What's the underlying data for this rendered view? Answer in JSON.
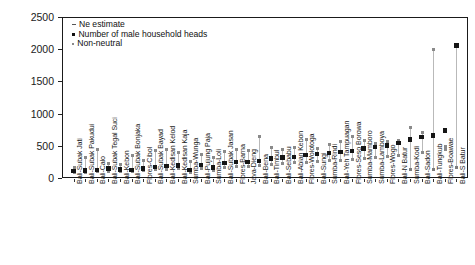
{
  "chart_data": {
    "type": "scatter",
    "title": "",
    "xlabel": "",
    "ylabel": "Effective size (Ne)",
    "ylim": [
      0,
      2500
    ],
    "yticks": [
      0,
      500,
      1000,
      1500,
      2000,
      2500
    ],
    "grid": true,
    "legend_position": "top-left",
    "legend": [
      {
        "marker": "dash",
        "label": "Ne estimate"
      },
      {
        "marker": "dot",
        "label": "Number of male household heads"
      },
      {
        "marker": "tiny",
        "label": "Non-neutral"
      }
    ],
    "categories": [
      "Bali-Subak Jati",
      "Bali-Subak Pakudui",
      "Bali-Calo",
      "Bali-Subak Tegal Suci",
      "Bali-Kebon",
      "Bali-Subak Bonjaka",
      "Flores-Cibol",
      "Bali-Subak Bayad",
      "Bali-Kedisan Kelod",
      "Bali-Kedisan Kaja",
      "Sumba-Wunga",
      "Bali-Pujung Paja",
      "Sumba-Loli",
      "Bali-Subak Jasan",
      "Flores-Barna",
      "Java-Dieng",
      "Bali-Bena",
      "Bali-Timbul",
      "Bali-Sebabu",
      "Bali-Abian Kebon",
      "Flores-Wolotoga",
      "Bali-Sungi",
      "Sumba-Rindi",
      "Bali-Yeh Tampuagan",
      "Flores-Seso Borowa",
      "Sumba-Mamboro",
      "Sumba-Lamboya",
      "Flores-Wogo",
      "Bali-N Batur",
      "Sumba-Kodi",
      "Bali-Sadon",
      "Bali-Tungkub",
      "Flores-Boawae",
      "Bali-S Batur"
    ],
    "series": [
      {
        "name": "Number of male household heads",
        "values": [
          110,
          118,
          122,
          145,
          130,
          128,
          150,
          175,
          185,
          195,
          120,
          205,
          165,
          230,
          245,
          250,
          268,
          300,
          318,
          330,
          360,
          372,
          392,
          405,
          420,
          455,
          480,
          505,
          540,
          598,
          640,
          662,
          740,
          2058
        ]
      },
      {
        "name": "Ne estimate upper",
        "values": [
          168,
          322,
          448,
          228,
          212,
          350,
          268,
          420,
          450,
          400,
          250,
          365,
          318,
          412,
          450,
          428,
          650,
          470,
          438,
          470,
          600,
          458,
          520,
          560,
          650,
          580,
          530,
          560,
          590,
          780,
          700,
          2000,
          488,
          2058
        ]
      },
      {
        "name": "Ne estimate lower",
        "values": [
          82,
          90,
          95,
          108,
          100,
          98,
          112,
          128,
          136,
          140,
          92,
          150,
          122,
          168,
          176,
          182,
          190,
          215,
          225,
          235,
          248,
          255,
          268,
          278,
          286,
          302,
          315,
          330,
          345,
          130,
          395,
          128,
          440,
          160
        ]
      }
    ],
    "non_neutral_markers": [
      {
        "index": 29,
        "value": 130
      },
      {
        "index": 31,
        "value": 128
      },
      {
        "index": 33,
        "value": 160
      }
    ]
  }
}
